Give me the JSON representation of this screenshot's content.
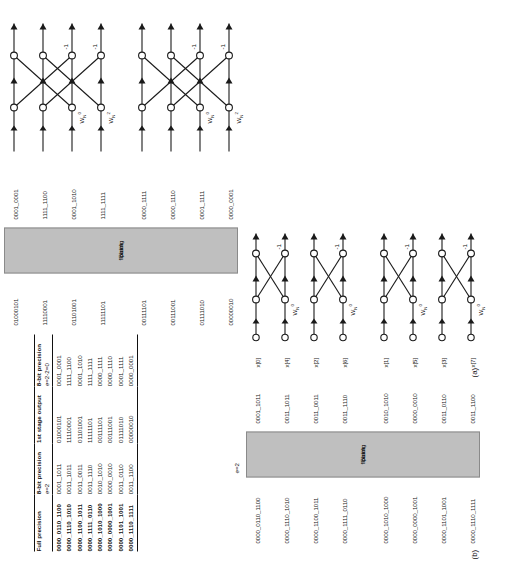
{
  "figure": {
    "panel_a_tag": "(a)",
    "panel_b_tag": "(b)"
  },
  "table": {
    "headers_top": [
      "Full precision",
      "8-bit precision",
      "1st stage output",
      "8-bit precision"
    ],
    "headers_sub": [
      "",
      "e=2",
      "",
      "e=2-2=0"
    ],
    "rows": [
      [
        "0000_0110_1100",
        "0001_1011",
        "01000101",
        "0001_0001"
      ],
      [
        "0000_1110_1010",
        "0011_1011",
        "11110001",
        "1111_1100"
      ],
      [
        "0000_1100_1011",
        "0011_0011",
        "01101001",
        "0001_1010"
      ],
      [
        "0000_1111_0110",
        "0011_1110",
        "11111101",
        "1111_1111"
      ],
      [
        "0000_1010_1000",
        "0010_1010",
        "00111101",
        "0000_1111"
      ],
      [
        "0000_0000_1001",
        "0000_0010",
        "00111001",
        "0000_1110"
      ],
      [
        "0000_1101_1001",
        "0011_0110",
        "01111010",
        "0001_1111"
      ],
      [
        "0000_1110_1111",
        "0011_1100",
        "00000010",
        "0000_0001"
      ]
    ]
  },
  "panel_a": {
    "e_note": "e=2-2=0",
    "block": {
      "line1": "Block",
      "line2": "floating",
      "line3": "point"
    },
    "inputs_left": [
      "01000101",
      "11110001",
      "01101001",
      "11111101",
      "00111101",
      "00111001",
      "01111010",
      "00000010"
    ],
    "outputs_right": [
      "0001_0001",
      "1111_1100",
      "0001_1010",
      "1111_1111",
      "0000_1111",
      "0000_1110",
      "0001_1111",
      "0000_0001"
    ],
    "twiddles": [
      "W",
      "W",
      "W",
      "W"
    ],
    "twiddle_subs": [
      "N",
      "N",
      "N",
      "N"
    ],
    "twiddle_sups": [
      "0",
      "2",
      "0",
      "2"
    ],
    "neg_one": "-1"
  },
  "panel_b": {
    "e_note": "e=2",
    "block": {
      "line1": "Block",
      "line2": "floating",
      "line3": "point"
    },
    "inputs_full": [
      "0000_0110_1100",
      "0000_1110_1010",
      "0000_1100_1011",
      "0000_1111_0110",
      "0000_1010_1000",
      "0000_0000_1001",
      "0000_1101_1001",
      "0000_1110_1111"
    ],
    "inputs_8bit": [
      "0001_1011",
      "0011_1011",
      "0011_0011",
      "0011_1110",
      "0010_1010",
      "0000_0010",
      "0011_0110",
      "0011_1100"
    ],
    "x_labels": [
      "x[0]",
      "x[4]",
      "x[2]",
      "x[6]",
      "x[1]",
      "x[5]",
      "x[3]",
      "x[7]"
    ],
    "twiddles": [
      "W",
      "W",
      "W",
      "W"
    ],
    "twiddle_subs": [
      "N",
      "N",
      "N",
      "N"
    ],
    "twiddle_sups": [
      "0",
      "0",
      "0",
      "0"
    ],
    "neg_one": "-1"
  },
  "colors": {
    "block_fill": "#bfbfbf",
    "line": "#1a1a1a",
    "text": "#111111"
  }
}
